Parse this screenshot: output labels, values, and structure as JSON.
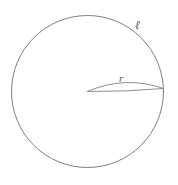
{
  "figure": {
    "kind": "geometry-diagram",
    "background_color": "#ffffff",
    "stroke_color": "#6f6f6f",
    "label_color": "#555555",
    "canvas": {
      "width": 178,
      "height": 185
    },
    "circle": {
      "name": "main-circle",
      "center_x": 87.5,
      "center_y": 91.5,
      "radius": 76
    },
    "radius_line": {
      "name": "radius-segment",
      "x1": 87.5,
      "y1": 91.5,
      "x2": 163.5,
      "y2": 88.5
    },
    "lens": {
      "name": "lens-sliver",
      "tip_left_x": 87.5,
      "tip_left_y": 91.5,
      "tip_right_x": 163.5,
      "tip_right_y": 88.5,
      "bulge_y": 82.5
    },
    "labels": {
      "arc_length": "ℓ",
      "radius": "r"
    }
  }
}
